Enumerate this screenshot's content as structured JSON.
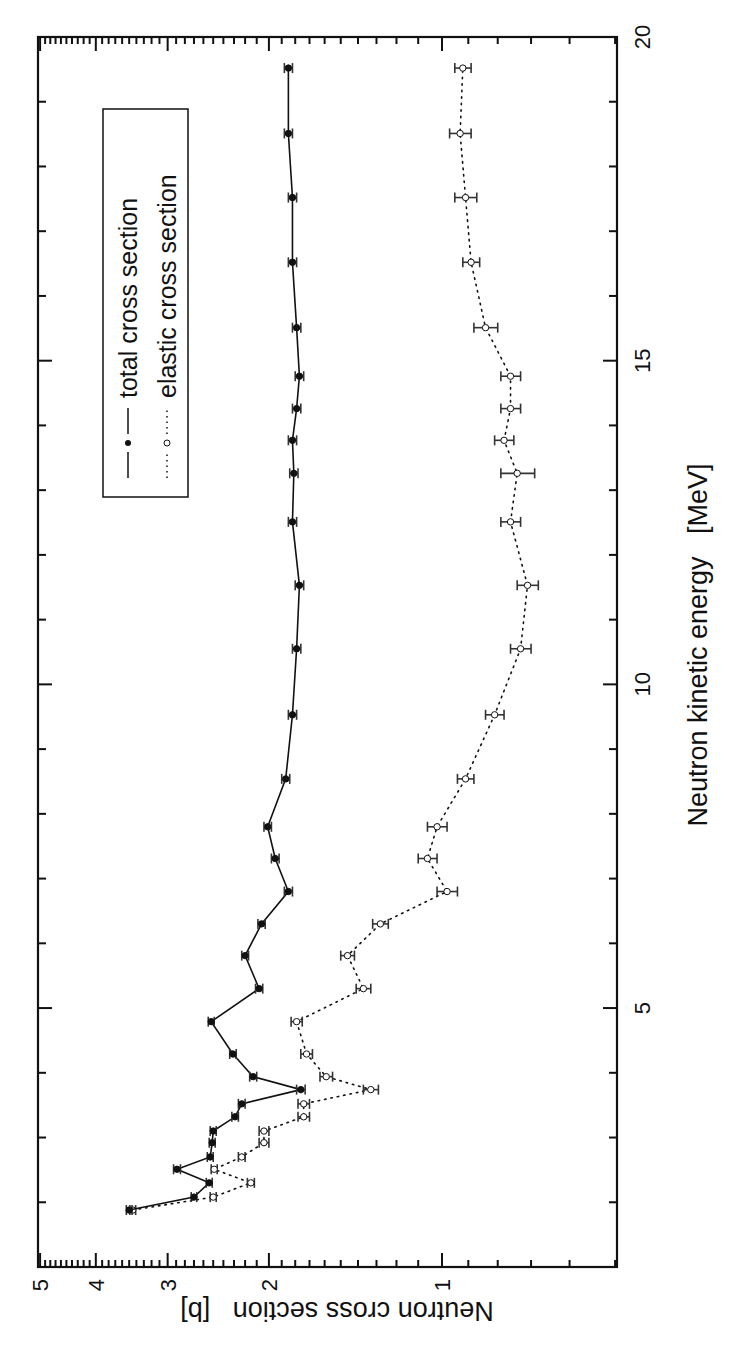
{
  "chart_data": {
    "type": "line",
    "title": "",
    "orientation": "figure rotated 90 degrees counter-clockwise",
    "xlabel": "Neutron kinetic energy   [MeV]",
    "ylabel": "Neutron cross section   [b]",
    "xlim": [
      1,
      20
    ],
    "ylim": [
      0.5,
      5
    ],
    "yscale": "log",
    "grid": false,
    "x_ticks": [
      5,
      10,
      15,
      20
    ],
    "y_ticks": [
      1,
      2,
      3,
      4,
      5
    ],
    "legend_position": "upper left (in rotated view)",
    "series": [
      {
        "name": "total cross section",
        "line_style": "solid",
        "marker": "filled-circle",
        "color": "#111111",
        "x": [
          1.88,
          2.08,
          2.3,
          2.51,
          2.7,
          2.92,
          3.1,
          3.32,
          3.52,
          3.74,
          3.94,
          4.29,
          4.79,
          5.3,
          5.81,
          6.3,
          6.8,
          7.31,
          7.8,
          8.54,
          9.53,
          10.55,
          11.53,
          12.51,
          13.26,
          13.77,
          14.26,
          14.76,
          15.51,
          16.52,
          17.52,
          18.51,
          19.52
        ],
        "values": [
          3.5,
          2.7,
          2.54,
          2.89,
          2.53,
          2.51,
          2.5,
          2.29,
          2.23,
          1.76,
          2.13,
          2.31,
          2.52,
          2.08,
          2.2,
          2.06,
          1.85,
          1.95,
          2.01,
          1.87,
          1.82,
          1.79,
          1.77,
          1.82,
          1.81,
          1.82,
          1.79,
          1.77,
          1.79,
          1.82,
          1.82,
          1.85,
          1.85
        ],
        "errors": [
          0.04,
          0.03,
          0.03,
          0.04,
          0.03,
          0.03,
          0.03,
          0.03,
          0.03,
          0.03,
          0.03,
          0.03,
          0.03,
          0.03,
          0.03,
          0.03,
          0.03,
          0.03,
          0.03,
          0.03,
          0.03,
          0.03,
          0.03,
          0.03,
          0.03,
          0.03,
          0.03,
          0.03,
          0.03,
          0.03,
          0.03,
          0.03,
          0.03
        ]
      },
      {
        "name": "elastic cross section",
        "line_style": "dotted",
        "marker": "open-circle",
        "color": "#111111",
        "x": [
          1.88,
          2.08,
          2.3,
          2.51,
          2.7,
          2.92,
          3.1,
          3.32,
          3.52,
          3.74,
          3.94,
          4.29,
          4.79,
          5.3,
          5.81,
          6.3,
          6.8,
          7.31,
          7.8,
          8.54,
          9.53,
          10.55,
          11.53,
          12.51,
          13.26,
          13.77,
          14.26,
          14.76,
          15.51,
          16.52,
          17.52,
          18.51,
          19.52
        ],
        "values": [
          3.45,
          2.5,
          2.15,
          2.49,
          2.23,
          2.04,
          2.04,
          1.74,
          1.74,
          1.33,
          1.59,
          1.72,
          1.79,
          1.37,
          1.46,
          1.28,
          0.98,
          1.06,
          1.02,
          0.91,
          0.81,
          0.73,
          0.71,
          0.76,
          0.74,
          0.78,
          0.76,
          0.76,
          0.84,
          0.89,
          0.91,
          0.93,
          0.92
        ],
        "errors": [
          0.04,
          0.03,
          0.03,
          0.03,
          0.03,
          0.04,
          0.04,
          0.04,
          0.04,
          0.04,
          0.04,
          0.04,
          0.04,
          0.04,
          0.04,
          0.04,
          0.04,
          0.04,
          0.04,
          0.03,
          0.03,
          0.03,
          0.03,
          0.03,
          0.05,
          0.03,
          0.03,
          0.03,
          0.04,
          0.03,
          0.04,
          0.04,
          0.03
        ]
      }
    ]
  },
  "legend": {
    "items": [
      {
        "label": "total cross section"
      },
      {
        "label": "elastic cross section"
      }
    ]
  },
  "axes": {
    "energy_label": "Neutron kinetic energy   [MeV]",
    "cross_section_label": "Neutron cross section   [b]",
    "energy_tick_labels": [
      "5",
      "10",
      "15",
      "20"
    ],
    "cross_section_tick_labels": [
      "5",
      "4",
      "3",
      "2",
      "1"
    ]
  },
  "style": {
    "ink": "#111111",
    "background": "#ffffff"
  }
}
